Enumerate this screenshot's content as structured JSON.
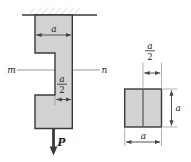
{
  "diagram": {
    "bar": {
      "top_width_label": "a",
      "notch_frac_numerator": "a",
      "notch_frac_denominator": "2",
      "section_label_left": "m",
      "section_label_right": "n",
      "load_label": "P"
    },
    "cross_section": {
      "top_frac_numerator": "a",
      "top_frac_denominator": "2",
      "height_label": "a",
      "width_label": "a"
    }
  },
  "colors": {
    "background": "#ffffff",
    "bar_fill": "#d2d2d2",
    "outline_ink": "#3a3a3a",
    "divider_ink": "#4a4a4a",
    "dim_ink": "#444444",
    "thin_line": "#8f8f8f",
    "hatch": "#dcdcdc",
    "label_ink": "#222222"
  }
}
